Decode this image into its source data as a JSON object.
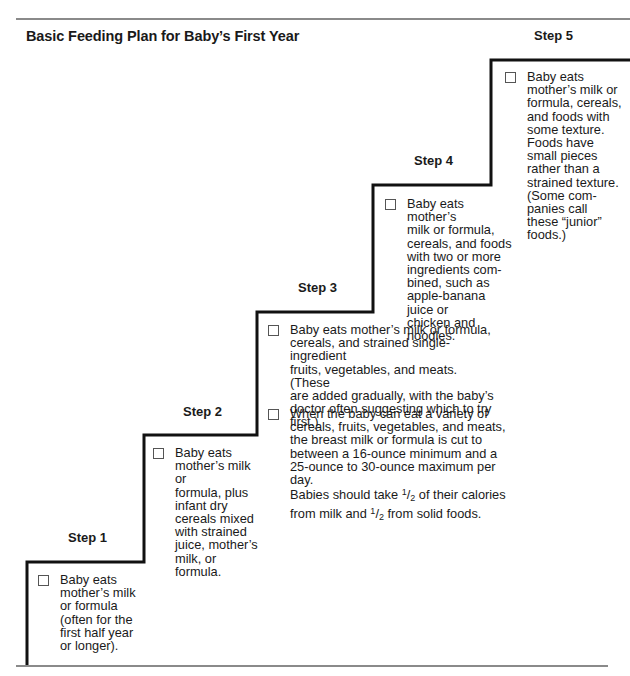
{
  "document": {
    "title": "Basic Feeding Plan for Baby’s First Year"
  },
  "steps": [
    {
      "label": "Step 1",
      "items": [
        {
          "text": "Baby eats\nmother’s milk\nor formula\n(often for the\nfirst half year\nor longer)."
        }
      ]
    },
    {
      "label": "Step 2",
      "items": [
        {
          "text": "Baby eats\nmother’s milk or\nformula, plus\ninfant dry\ncereals mixed\nwith strained\njuice, mother’s\nmilk, or formula."
        }
      ]
    },
    {
      "label": "Step 3",
      "items": [
        {
          "text": "Baby eats mother’s milk or formula,\ncereals, and strained single-ingredient\nfruits, vegetables, and meats. (These\nare added gradually, with the baby’s\ndoctor often suggesting which to try\nfirst.)"
        },
        {
          "text_before": "When the baby can eat a variety of\ncereals, fruits, vegetables, and meats,\nthe breast milk or formula is cut to\nbetween a 16-ounce minimum and a\n25-ounce to 30-ounce maximum per day.\nBabies should take ",
          "fraction": "1/2",
          "text_middle": " of their calories\nfrom milk and ",
          "text_after": " from solid foods.",
          "frac_num": "1",
          "frac_den": "2"
        }
      ]
    },
    {
      "label": "Step 4",
      "items": [
        {
          "text": "Baby eats mother’s\nmilk or formula,\ncereals, and foods\nwith two or more\ningredients com-\nbined, such as\napple-banana juice or\nchicken and noodles."
        }
      ]
    },
    {
      "label": "Step 5",
      "items": [
        {
          "text": "Baby eats\nmother’s milk or\nformula, cereals,\nand foods with\nsome texture.\nFoods have\nsmall pieces\nrather than a\nstrained texture.\n(Some com-\npanies call\nthese “junior”\nfoods.)"
        }
      ]
    }
  ],
  "colors": {
    "stair_line": "#111111",
    "rule": "#8a8a8a",
    "text": "#1a1a1a"
  }
}
